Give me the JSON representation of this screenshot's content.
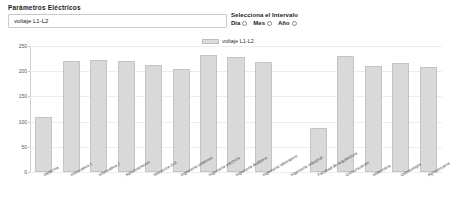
{
  "form": {
    "title": "Parámetros Eléctricos",
    "parameter_value": "voltaje L1-L2",
    "parameter_placeholder": "voltaje L1-L2",
    "interval_title": "Selecciona el Intervalo",
    "interval_options": [
      {
        "label": "Día",
        "selected": false
      },
      {
        "label": "Mes",
        "selected": false
      },
      {
        "label": "Año",
        "selected": false
      }
    ]
  },
  "chart_data": {
    "type": "bar",
    "title": "",
    "legend": [
      "voltaje L1-L2"
    ],
    "legend_position": "top-center",
    "series_color": "#d9d9d9",
    "xlabel": "",
    "ylabel": "",
    "ylim": [
      0,
      250
    ],
    "yticks": [
      0,
      50,
      100,
      150,
      200,
      250
    ],
    "grid": true,
    "categories": [
      "Medicina",
      "Informática 1",
      "Informática 2",
      "Administración",
      "Mecánica civil",
      "Ingeniería sistemas",
      "Ingeniería eléctrica",
      "Ingeniería Auditorio",
      "Ingeniería laboratorio",
      "Ingeniería industrial",
      "Facultad de arquitectura",
      "Comunicación",
      "Veterinaria",
      "Odontología",
      "Agropecuaria"
    ],
    "values": [
      110,
      220,
      222,
      220,
      212,
      205,
      232,
      228,
      218,
      0,
      88,
      231,
      210,
      217,
      208
    ]
  }
}
